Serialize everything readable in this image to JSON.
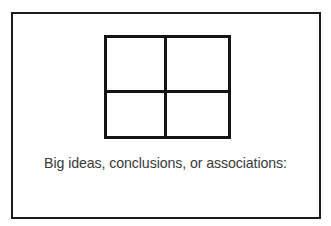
{
  "worksheet": {
    "caption": "Big ideas, conclusions, or associations:",
    "grid": {
      "rows": 2,
      "columns": 2
    },
    "colors": {
      "border": "#1c1c1c",
      "text": "#3a3a3a",
      "background": "#ffffff"
    }
  }
}
